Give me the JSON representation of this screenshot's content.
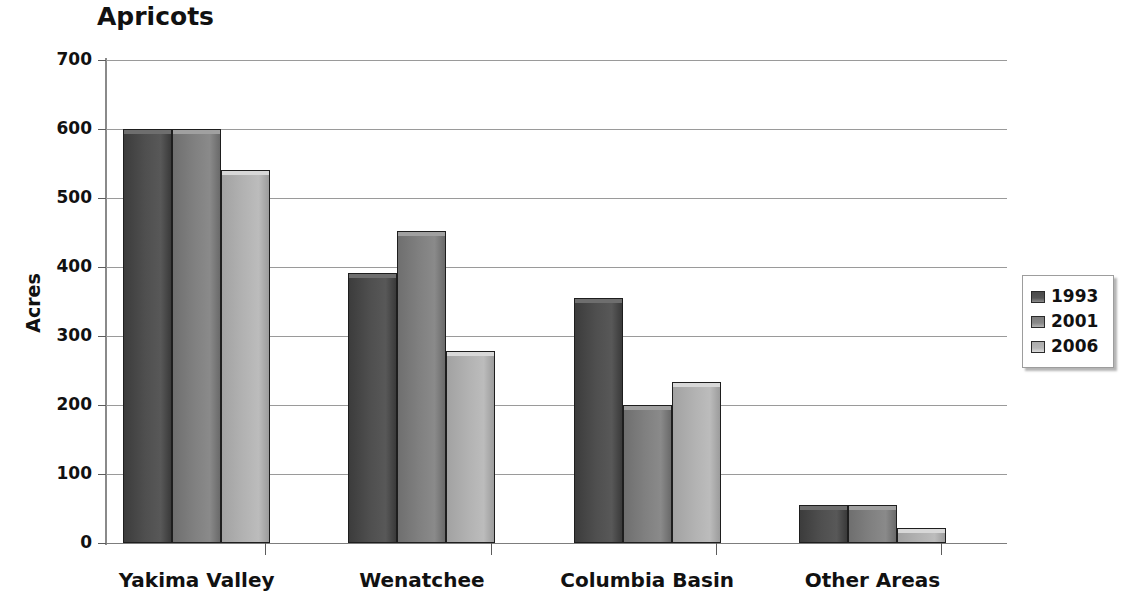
{
  "chart_data": {
    "type": "bar",
    "title": "Apricots",
    "xlabel": "",
    "ylabel": "Acres",
    "categories": [
      "Yakima Valley",
      "Wenatchee",
      "Columbia Basin",
      "Other Areas"
    ],
    "series": [
      {
        "name": "1993",
        "color": "#4a4a4a",
        "values": [
          600,
          392,
          355,
          55
        ]
      },
      {
        "name": "2001",
        "color": "#7d7d7d",
        "values": [
          600,
          452,
          200,
          55
        ]
      },
      {
        "name": "2006",
        "color": "#ababab",
        "values": [
          540,
          278,
          233,
          22
        ]
      }
    ],
    "ylim": [
      0,
      700
    ],
    "y_ticks": [
      700,
      600,
      500,
      400,
      300,
      200,
      100,
      0
    ],
    "grid": true,
    "legend_position": "right"
  },
  "legend": {
    "items": [
      {
        "label": "1993"
      },
      {
        "label": "2001"
      },
      {
        "label": "2006"
      }
    ]
  }
}
